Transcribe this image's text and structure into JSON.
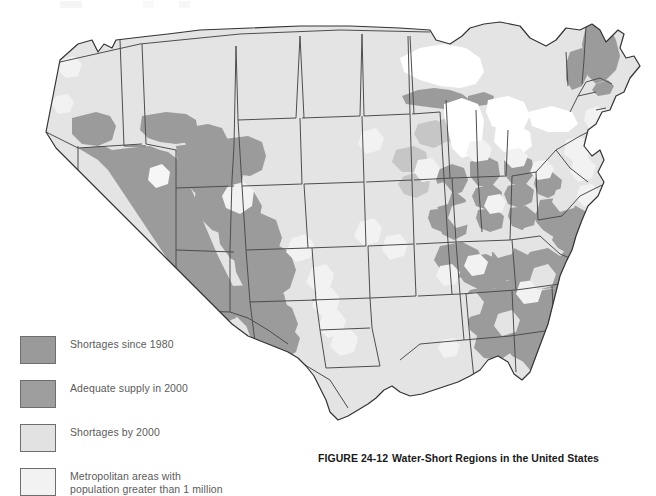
{
  "figure": {
    "caption_number": "FIGURE 24-12",
    "caption_title": "Water-Short Regions in the United States"
  },
  "legend": {
    "items": [
      {
        "label": "Shortages since 1980",
        "color": "#9a9a9a",
        "swatch_name": "legend-swatch-shortages-since-1980"
      },
      {
        "label": "Adequate supply in 2000",
        "color": "#9e9e9e",
        "swatch_name": "legend-swatch-adequate-supply-2000"
      },
      {
        "label": "Shortages by 2000",
        "color": "#e2e2e2",
        "swatch_name": "legend-swatch-shortages-by-2000"
      },
      {
        "label": "Metropolitan areas with\npopulation greater than 1 million",
        "color": "#f2f2f2",
        "swatch_name": "legend-swatch-metro-areas"
      }
    ]
  },
  "map": {
    "title": "Water-Short Regions in the United States",
    "subject": "contiguous United States choropleth",
    "colors": {
      "dark_gray": "#9a9a9a",
      "medium_gray": "#9e9e9e",
      "light_gray": "#e2e2e2",
      "near_white": "#f2f2f2",
      "white": "#ffffff",
      "outline": "#3a3a3a",
      "state_line": "#4a4a4a"
    },
    "categories": {
      "dark_gray": "Shortages since 1980 / Adequate supply in 2000",
      "light_gray": "Shortages by 2000",
      "near_white": "Metropolitan areas with population greater than 1 million"
    },
    "regions_dark": [
      "Nevada",
      "Utah",
      "Arizona",
      "New Mexico",
      "western Texas",
      "southeastern Oregon / southern Idaho",
      "western Colorado",
      "Michigan Upper Peninsula",
      "Maine",
      "New Hampshire",
      "Indiana",
      "Ohio",
      "Kentucky",
      "West Virginia",
      "Virginia",
      "North Carolina",
      "South Carolina",
      "Georgia",
      "Alabama",
      "Mississippi",
      "Tennessee",
      "southern Florida coast"
    ],
    "regions_light": [
      "Washington",
      "Oregon",
      "California",
      "Montana",
      "Wyoming",
      "North Dakota",
      "South Dakota",
      "Nebraska",
      "Kansas",
      "Oklahoma",
      "eastern Texas",
      "Minnesota",
      "Iowa",
      "Missouri",
      "Arkansas",
      "Louisiana",
      "Wisconsin",
      "Illinois",
      "Pennsylvania",
      "New York",
      "New England",
      "Florida interior"
    ],
    "metro_patches": [
      "Los Angeles",
      "San Francisco",
      "San Diego",
      "Phoenix",
      "Tucson",
      "Denver",
      "Salt Lake City",
      "Dallas-Fort Worth",
      "Houston",
      "San Antonio",
      "Chicago",
      "Detroit",
      "Minneapolis",
      "St. Louis",
      "Atlanta",
      "Miami",
      "Tampa",
      "New York",
      "Philadelphia",
      "Boston",
      "Washington DC",
      "Seattle",
      "Portland",
      "Cleveland",
      "Pittsburgh",
      "Cincinnati",
      "Kansas City",
      "New Orleans"
    ]
  }
}
